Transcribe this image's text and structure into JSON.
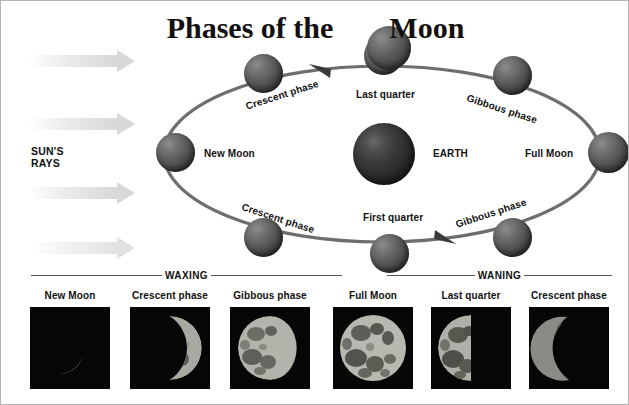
{
  "title": {
    "part1": "Phases of the",
    "part2": "Moon"
  },
  "sun": {
    "label_line1": "SUN'S",
    "label_line2": "RAYS",
    "ray_count": 4,
    "arrow_color": "#d8d8d8",
    "direction": "right"
  },
  "diagram": {
    "center_body": "EARTH",
    "orbit_direction": "counterclockwise",
    "orbit_color": "#6e6e6e",
    "labels": [
      {
        "text": "New Moon",
        "name": "orbit-label-new-moon"
      },
      {
        "text": "Crescent phase",
        "name": "orbit-label-crescent-waxing"
      },
      {
        "text": "Last quarter",
        "name": "orbit-label-last-quarter"
      },
      {
        "text": "Gibbous phase",
        "name": "orbit-label-gibbous-waning"
      },
      {
        "text": "Full Moon",
        "name": "orbit-label-full-moon"
      },
      {
        "text": "Gibbous phase",
        "name": "orbit-label-gibbous-waxing"
      },
      {
        "text": "First quarter",
        "name": "orbit-label-first-quarter"
      },
      {
        "text": "Crescent phase",
        "name": "orbit-label-crescent-waning"
      },
      {
        "text": "EARTH",
        "name": "orbit-label-earth"
      }
    ]
  },
  "bands": {
    "waxing": "WAXING",
    "waning": "WANING"
  },
  "photos": [
    {
      "caption": "New Moon",
      "phase": "new"
    },
    {
      "caption": "Crescent phase",
      "phase": "crescent-right"
    },
    {
      "caption": "Gibbous phase",
      "phase": "gibbous-right"
    },
    {
      "caption": "Full Moon",
      "phase": "full"
    },
    {
      "caption": "Last quarter",
      "phase": "half-left"
    },
    {
      "caption": "Crescent phase",
      "phase": "crescent-left"
    }
  ]
}
